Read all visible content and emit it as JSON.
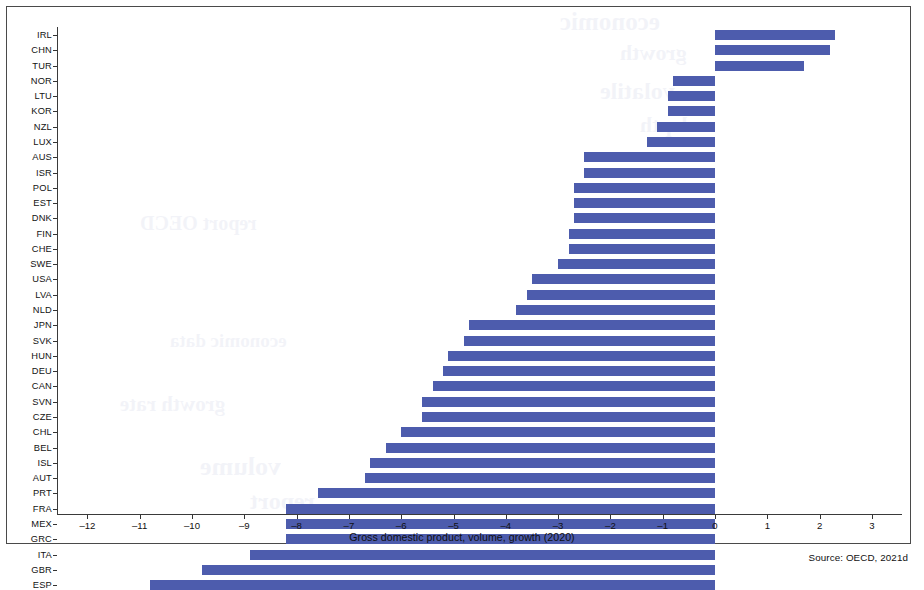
{
  "chart_data": {
    "type": "bar",
    "orientation": "horizontal",
    "title": "",
    "xlabel": "Gross domestic product, volume, growth (2020)",
    "ylabel": "",
    "xlim": [
      -12.6,
      3.6
    ],
    "xticks": [
      -12,
      -11,
      -10,
      -9,
      -8,
      -7,
      -6,
      -5,
      -4,
      -3,
      -2,
      -1,
      0,
      1,
      2,
      3
    ],
    "xtick_labels": [
      "–12",
      "–11",
      "–10",
      "–9",
      "–8",
      "–7",
      "–6",
      "–5",
      "–4",
      "–3",
      "–2",
      "–1",
      "0",
      "1",
      "2",
      "3"
    ],
    "grid": false,
    "legend": null,
    "bar_color": "#4d5cad",
    "categories": [
      "IRL",
      "CHN",
      "TUR",
      "NOR",
      "LTU",
      "KOR",
      "NZL",
      "LUX",
      "AUS",
      "ISR",
      "POL",
      "EST",
      "DNK",
      "FIN",
      "CHE",
      "SWE",
      "USA",
      "LVA",
      "NLD",
      "JPN",
      "SVK",
      "HUN",
      "DEU",
      "CAN",
      "SVN",
      "CZE",
      "CHL",
      "BEL",
      "ISL",
      "AUT",
      "PRT",
      "FRA",
      "MEX",
      "GRC",
      "ITA",
      "GBR",
      "ESP"
    ],
    "values": [
      2.3,
      2.2,
      1.7,
      -0.8,
      -0.9,
      -0.9,
      -1.1,
      -1.3,
      -2.5,
      -2.5,
      -2.7,
      -2.7,
      -2.7,
      -2.8,
      -2.8,
      -3.0,
      -3.5,
      -3.6,
      -3.8,
      -4.7,
      -4.8,
      -5.1,
      -5.2,
      -5.4,
      -5.6,
      -5.6,
      -6.0,
      -6.3,
      -6.6,
      -6.7,
      -7.6,
      -8.2,
      -8.2,
      -8.2,
      -8.9,
      -9.8,
      -10.8
    ],
    "series": [
      {
        "name": "GDP volume growth 2020 (%)",
        "values": [
          2.3,
          2.2,
          1.7,
          -0.8,
          -0.9,
          -0.9,
          -1.1,
          -1.3,
          -2.5,
          -2.5,
          -2.7,
          -2.7,
          -2.7,
          -2.8,
          -2.8,
          -3.0,
          -3.5,
          -3.6,
          -3.8,
          -4.7,
          -4.8,
          -5.1,
          -5.2,
          -5.4,
          -5.6,
          -5.6,
          -6.0,
          -6.3,
          -6.6,
          -6.7,
          -7.6,
          -8.2,
          -8.2,
          -8.2,
          -8.9,
          -9.8,
          -10.8
        ]
      }
    ]
  },
  "figure": {
    "source_note": "Source: OECD, 2021d",
    "x_axis_title": "Gross domestic product, volume, growth (2020)"
  },
  "bleed_text": [
    "OECD",
    "growth",
    "volatile",
    "economic",
    "depth",
    "report"
  ]
}
